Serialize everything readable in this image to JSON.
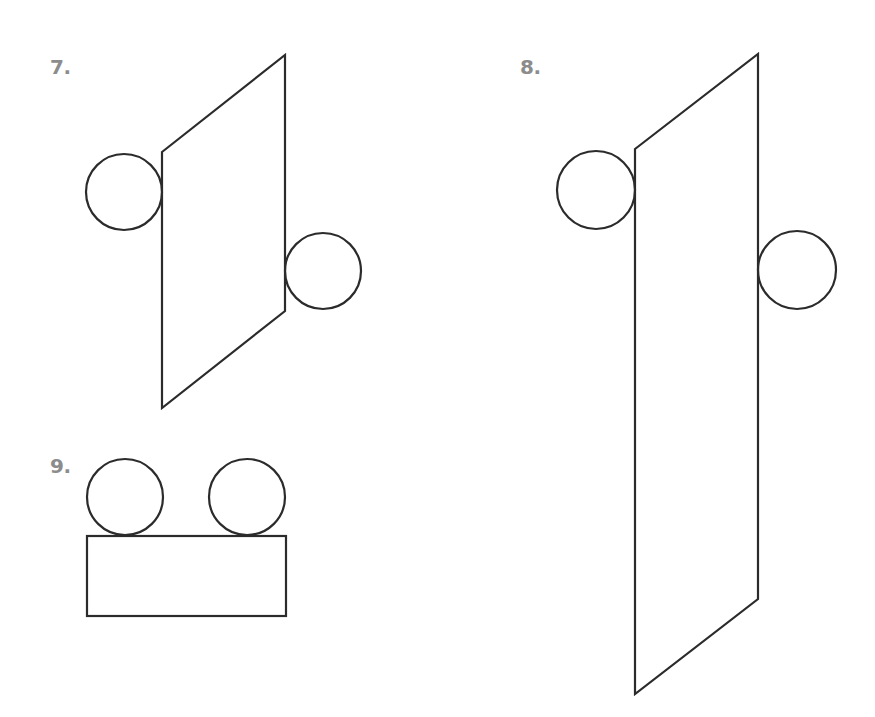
{
  "colors": {
    "label": "#8c8c8c",
    "stroke": "#2b2b2b",
    "background": "#ffffff"
  },
  "figures": [
    {
      "label": "7.",
      "label_pos": [
        50,
        57
      ],
      "parallelogram": [
        [
          162,
          152
        ],
        [
          285,
          55
        ],
        [
          285,
          311
        ],
        [
          162,
          408
        ]
      ],
      "circles": [
        {
          "cx": 124,
          "cy": 192,
          "r": 38
        },
        {
          "cx": 323,
          "cy": 271,
          "r": 38
        }
      ]
    },
    {
      "label": "8.",
      "label_pos": [
        520,
        57
      ],
      "parallelogram": [
        [
          635,
          149
        ],
        [
          758,
          54
        ],
        [
          758,
          599
        ],
        [
          635,
          694
        ]
      ],
      "circles": [
        {
          "cx": 596,
          "cy": 190,
          "r": 39
        },
        {
          "cx": 797,
          "cy": 270,
          "r": 39
        }
      ]
    },
    {
      "label": "9.",
      "label_pos": [
        50,
        456
      ],
      "rectangle": {
        "x": 87,
        "y": 536,
        "w": 199,
        "h": 80
      },
      "circles": [
        {
          "cx": 125,
          "cy": 497,
          "r": 38
        },
        {
          "cx": 247,
          "cy": 497,
          "r": 38
        }
      ]
    }
  ]
}
